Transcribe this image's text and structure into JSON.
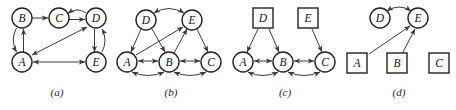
{
  "figure": {
    "background_color": "#ffffff",
    "stroke_color": "#3a3a3a",
    "node_fill": "#ffffff",
    "label_color": "#111111",
    "panels": [
      {
        "id": "panel-a",
        "caption": "(a)",
        "node_shape": "circle",
        "nodes": [
          {
            "id": "B",
            "label": "B",
            "shape": "circle",
            "x": 22,
            "y": 18
          },
          {
            "id": "C",
            "label": "C",
            "shape": "circle",
            "x": 59,
            "y": 18
          },
          {
            "id": "D",
            "label": "D",
            "shape": "circle",
            "x": 96,
            "y": 18
          },
          {
            "id": "A",
            "label": "A",
            "shape": "circle",
            "x": 22,
            "y": 62
          },
          {
            "id": "E",
            "label": "E",
            "shape": "circle",
            "x": 96,
            "y": 62
          }
        ],
        "edges": [
          {
            "from": "B",
            "to": "C",
            "style": "straight",
            "arrows": "forward"
          },
          {
            "from": "C",
            "to": "D",
            "style": "straight",
            "arrows": "forward"
          },
          {
            "from": "D",
            "to": "C",
            "style": "curved",
            "arrows": "forward"
          },
          {
            "from": "A",
            "to": "B",
            "style": "straight",
            "arrows": "forward"
          },
          {
            "from": "B",
            "to": "A",
            "style": "curved",
            "arrows": "forward"
          },
          {
            "from": "D",
            "to": "E",
            "style": "straight",
            "arrows": "forward"
          },
          {
            "from": "E",
            "to": "D",
            "style": "curved",
            "arrows": "forward"
          },
          {
            "from": "A",
            "to": "D",
            "style": "straight",
            "arrows": "both"
          },
          {
            "from": "A",
            "to": "E",
            "style": "straight",
            "arrows": "both"
          }
        ]
      },
      {
        "id": "panel-b",
        "caption": "(b)",
        "node_shape": "circle",
        "nodes": [
          {
            "id": "D",
            "label": "D",
            "shape": "circle",
            "x": 32,
            "y": 20
          },
          {
            "id": "E",
            "label": "E",
            "shape": "circle",
            "x": 78,
            "y": 20
          },
          {
            "id": "A",
            "label": "A",
            "shape": "circle",
            "x": 13,
            "y": 62
          },
          {
            "id": "B",
            "label": "B",
            "shape": "circle",
            "x": 55,
            "y": 62
          },
          {
            "id": "C",
            "label": "C",
            "shape": "circle",
            "x": 97,
            "y": 62
          }
        ],
        "edges": [
          {
            "from": "D",
            "to": "E",
            "style": "curved",
            "arrows": "both"
          },
          {
            "from": "D",
            "to": "A",
            "style": "straight",
            "arrows": "forward"
          },
          {
            "from": "D",
            "to": "B",
            "style": "straight",
            "arrows": "forward"
          },
          {
            "from": "E",
            "to": "C",
            "style": "straight",
            "arrows": "forward"
          },
          {
            "from": "B",
            "to": "E",
            "style": "straight",
            "arrows": "forward"
          },
          {
            "from": "A",
            "to": "E",
            "style": "straight",
            "arrows": "forward"
          },
          {
            "from": "A",
            "to": "B",
            "style": "straight",
            "arrows": "both"
          },
          {
            "from": "A",
            "to": "B",
            "style": "curved-below",
            "arrows": "both"
          },
          {
            "from": "B",
            "to": "C",
            "style": "straight",
            "arrows": "both"
          },
          {
            "from": "B",
            "to": "C",
            "style": "curved-below",
            "arrows": "both"
          }
        ]
      },
      {
        "id": "panel-c",
        "caption": "(c)",
        "node_shape": "mixed",
        "nodes": [
          {
            "id": "D",
            "label": "D",
            "shape": "square",
            "x": 35,
            "y": 18
          },
          {
            "id": "E",
            "label": "E",
            "shape": "square",
            "x": 80,
            "y": 18
          },
          {
            "id": "A",
            "label": "A",
            "shape": "circle",
            "x": 15,
            "y": 62
          },
          {
            "id": "B",
            "label": "B",
            "shape": "circle",
            "x": 55,
            "y": 62
          },
          {
            "id": "C",
            "label": "C",
            "shape": "circle",
            "x": 97,
            "y": 62
          }
        ],
        "edges": [
          {
            "from": "D",
            "to": "A",
            "style": "straight",
            "arrows": "forward"
          },
          {
            "from": "D",
            "to": "B",
            "style": "straight",
            "arrows": "forward"
          },
          {
            "from": "E",
            "to": "C",
            "style": "straight",
            "arrows": "forward"
          },
          {
            "from": "A",
            "to": "B",
            "style": "straight",
            "arrows": "both"
          },
          {
            "from": "A",
            "to": "B",
            "style": "curved-below",
            "arrows": "both"
          },
          {
            "from": "B",
            "to": "C",
            "style": "straight",
            "arrows": "both"
          },
          {
            "from": "B",
            "to": "C",
            "style": "curved-below",
            "arrows": "both"
          }
        ]
      },
      {
        "id": "panel-d",
        "caption": "(d)",
        "node_shape": "mixed",
        "nodes": [
          {
            "id": "D",
            "label": "D",
            "shape": "circle",
            "x": 38,
            "y": 18
          },
          {
            "id": "E",
            "label": "E",
            "shape": "circle",
            "x": 76,
            "y": 18
          },
          {
            "id": "A",
            "label": "A",
            "shape": "square",
            "x": 15,
            "y": 63
          },
          {
            "id": "B",
            "label": "B",
            "shape": "square",
            "x": 55,
            "y": 63
          },
          {
            "id": "C",
            "label": "C",
            "shape": "square",
            "x": 97,
            "y": 63
          }
        ],
        "edges": [
          {
            "from": "D",
            "to": "E",
            "style": "curved",
            "arrows": "both"
          },
          {
            "from": "A",
            "to": "E",
            "style": "straight",
            "arrows": "forward"
          },
          {
            "from": "B",
            "to": "E",
            "style": "straight",
            "arrows": "forward"
          }
        ]
      }
    ]
  }
}
